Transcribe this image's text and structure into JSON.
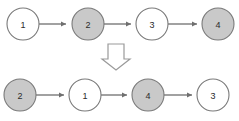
{
  "figure": {
    "title": "",
    "background_color": "#ffffff",
    "width": 239,
    "height": 121
  },
  "colors": {
    "node_stroke": "#7a7a7a",
    "node_fill_white": "#ffffff",
    "node_fill_gray": "#c9c9c9",
    "edge": "#6f6f6f",
    "arrow_stroke": "#9a9a9a",
    "arrow_fill": "#ffffff",
    "label_text": "#2b2b2b"
  },
  "rows": [
    {
      "name": "before",
      "nodes": [
        {
          "label": "1",
          "fill": "white",
          "cx": 23,
          "cy": 24
        },
        {
          "label": "2",
          "fill": "gray",
          "cx": 88,
          "cy": 24
        },
        {
          "label": "3",
          "fill": "white",
          "cx": 152,
          "cy": 24
        },
        {
          "label": "4",
          "fill": "gray",
          "cx": 218,
          "cy": 24
        }
      ],
      "edges": [
        {
          "from": "1",
          "to": "2"
        },
        {
          "from": "2",
          "to": "3"
        },
        {
          "from": "3",
          "to": "4"
        }
      ]
    },
    {
      "name": "after",
      "nodes": [
        {
          "label": "2",
          "fill": "gray",
          "cx": 20,
          "cy": 95
        },
        {
          "label": "1",
          "fill": "white",
          "cx": 85,
          "cy": 95
        },
        {
          "label": "4",
          "fill": "gray",
          "cx": 148,
          "cy": 95
        },
        {
          "label": "3",
          "fill": "white",
          "cx": 213,
          "cy": 95
        }
      ],
      "edges": [
        {
          "from": "2",
          "to": "1"
        },
        {
          "from": "1",
          "to": "4"
        },
        {
          "from": "4",
          "to": "3"
        }
      ]
    }
  ],
  "transform_arrow": {
    "direction": "down",
    "cx": 116,
    "top": 44,
    "bottom": 70
  },
  "node_radius": 16
}
